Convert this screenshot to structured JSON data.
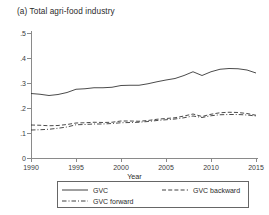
{
  "chart_data": {
    "type": "line",
    "title": "(a) Total agri-food industry",
    "xlabel": "Year",
    "ylabel": "",
    "xlim": [
      1990,
      2015
    ],
    "ylim": [
      0,
      0.5
    ],
    "grid": false,
    "legend_position": "bottom",
    "xticks": [
      "1990",
      "1995",
      "2000",
      "2005",
      "2010",
      "2015"
    ],
    "yticks": [
      "0",
      ".1",
      ".2",
      ".3",
      ".4",
      ".5"
    ],
    "x": [
      1990,
      1991,
      1992,
      1993,
      1994,
      1995,
      1996,
      1997,
      1998,
      1999,
      2000,
      2001,
      2002,
      2003,
      2004,
      2005,
      2006,
      2007,
      2008,
      2009,
      2010,
      2011,
      2012,
      2013,
      2014,
      2015
    ],
    "series": [
      {
        "name": "GVC",
        "style": "solid",
        "values": [
          0.258,
          0.255,
          0.25,
          0.254,
          0.262,
          0.275,
          0.277,
          0.281,
          0.281,
          0.283,
          0.29,
          0.291,
          0.291,
          0.297,
          0.305,
          0.312,
          0.318,
          0.33,
          0.345,
          0.33,
          0.345,
          0.355,
          0.358,
          0.357,
          0.352,
          0.34
        ]
      },
      {
        "name": "GVC backward",
        "style": "dashed",
        "values": [
          0.132,
          0.131,
          0.129,
          0.13,
          0.134,
          0.14,
          0.141,
          0.143,
          0.142,
          0.143,
          0.148,
          0.148,
          0.147,
          0.15,
          0.155,
          0.158,
          0.161,
          0.168,
          0.176,
          0.166,
          0.175,
          0.181,
          0.183,
          0.182,
          0.178,
          0.171
        ]
      },
      {
        "name": "GVC forward",
        "style": "dash-dot",
        "values": [
          0.112,
          0.113,
          0.115,
          0.119,
          0.124,
          0.133,
          0.134,
          0.136,
          0.136,
          0.138,
          0.141,
          0.142,
          0.143,
          0.146,
          0.15,
          0.153,
          0.156,
          0.161,
          0.168,
          0.162,
          0.169,
          0.173,
          0.174,
          0.174,
          0.172,
          0.168
        ]
      }
    ]
  },
  "legend": {
    "items": [
      {
        "label": "GVC",
        "style": "solid"
      },
      {
        "label": "GVC backward",
        "style": "dashed"
      },
      {
        "label": "GVC forward",
        "style": "dash-dot"
      }
    ]
  }
}
